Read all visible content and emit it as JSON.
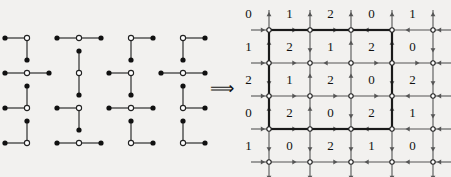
{
  "figure": {
    "implies_symbol": "⟹",
    "colors": {
      "background": "#f2f1ef",
      "ink": "#111111",
      "line": "#555555",
      "node_fill": "#111111",
      "node_hollow": "#ffffff",
      "border": "#1a1a1a"
    }
  },
  "left_panel": {
    "name": "piece-collection",
    "description": "Sixteen three-cell L / I shaped pieces arranged in a 4 by 4 layout. Each piece has one hollow center node and two solid end nodes.",
    "rows": 4,
    "cols": 4,
    "pieces": [
      {
        "id": "p1",
        "row": 0,
        "col": 0,
        "shape": "corner",
        "arms": [
          "left",
          "down"
        ]
      },
      {
        "id": "p2",
        "row": 0,
        "col": 1,
        "shape": "straight",
        "arms": [
          "left",
          "right"
        ]
      },
      {
        "id": "p3",
        "row": 0,
        "col": 2,
        "shape": "corner",
        "arms": [
          "right",
          "down"
        ]
      },
      {
        "id": "p4",
        "row": 0,
        "col": 3,
        "shape": "corner",
        "arms": [
          "right",
          "down"
        ]
      },
      {
        "id": "p5",
        "row": 1,
        "col": 0,
        "shape": "straight",
        "arms": [
          "left",
          "right"
        ]
      },
      {
        "id": "p6",
        "row": 1,
        "col": 1,
        "shape": "straight",
        "arms": [
          "up",
          "down"
        ]
      },
      {
        "id": "p7",
        "row": 1,
        "col": 2,
        "shape": "corner",
        "arms": [
          "left",
          "down"
        ]
      },
      {
        "id": "p8",
        "row": 1,
        "col": 3,
        "shape": "straight",
        "arms": [
          "left",
          "right"
        ]
      },
      {
        "id": "p9",
        "row": 2,
        "col": 0,
        "shape": "corner",
        "arms": [
          "left",
          "up"
        ]
      },
      {
        "id": "p10",
        "row": 2,
        "col": 1,
        "shape": "corner",
        "arms": [
          "left",
          "down"
        ]
      },
      {
        "id": "p11",
        "row": 2,
        "col": 2,
        "shape": "straight",
        "arms": [
          "left",
          "right"
        ]
      },
      {
        "id": "p12",
        "row": 2,
        "col": 3,
        "shape": "corner",
        "arms": [
          "right",
          "up"
        ]
      },
      {
        "id": "p13",
        "row": 3,
        "col": 0,
        "shape": "corner",
        "arms": [
          "left",
          "up"
        ]
      },
      {
        "id": "p14",
        "row": 3,
        "col": 1,
        "shape": "straight",
        "arms": [
          "left",
          "right"
        ]
      },
      {
        "id": "p15",
        "row": 3,
        "col": 2,
        "shape": "corner",
        "arms": [
          "right",
          "up"
        ]
      },
      {
        "id": "p16",
        "row": 3,
        "col": 3,
        "shape": "corner",
        "arms": [
          "right",
          "up"
        ]
      }
    ]
  },
  "right_panel": {
    "name": "labelled-arrow-grid",
    "description": "A 5 by 5 array of number labels overlaid on a 5 by 5 lattice of nodes with directed edges; a heavy rectangle encloses the inner 3 by 3 block of labels.",
    "label_rows": 5,
    "label_cols": 5,
    "labels": [
      [
        0,
        1,
        2,
        0,
        1
      ],
      [
        1,
        2,
        1,
        2,
        0
      ],
      [
        2,
        1,
        2,
        0,
        2
      ],
      [
        0,
        2,
        0,
        2,
        1
      ],
      [
        1,
        0,
        2,
        1,
        0
      ]
    ],
    "horizontal_edges": [
      [
        "right",
        "right",
        "left",
        "left",
        "left"
      ],
      [
        "right",
        "left",
        "right",
        "right",
        "left"
      ],
      [
        "right",
        "right",
        "right",
        "left",
        "left"
      ],
      [
        "right",
        "right",
        "left",
        "left",
        "left"
      ]
    ],
    "vertical_edges": [
      [
        "up",
        "up",
        "up",
        "up",
        "up"
      ],
      [
        "up",
        "down",
        "up",
        "up",
        "down"
      ],
      [
        "down",
        "up",
        "up",
        "down",
        "down"
      ],
      [
        "up",
        "up",
        "down",
        "up",
        "down"
      ],
      [
        "down",
        "down",
        "down",
        "down",
        "down"
      ]
    ],
    "boundary_rect": {
      "from_row": 0,
      "to_row": 3,
      "from_col": 0,
      "to_col": 3
    }
  }
}
